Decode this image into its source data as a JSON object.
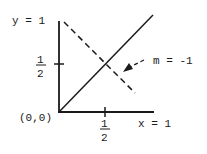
{
  "diagram": {
    "type": "line-graph",
    "labels": {
      "y_top": "y = 1",
      "x_right": "x = 1",
      "origin": "(0,0)",
      "half_num": "1",
      "half_den": "2",
      "slope": "m = -1"
    },
    "lines": [
      {
        "name": "solid-line",
        "style": "solid",
        "from": [
          0,
          0
        ],
        "to": [
          1,
          1
        ]
      },
      {
        "name": "dashed-line",
        "style": "dashed",
        "from": [
          0,
          1
        ],
        "to": [
          0.75,
          0.25
        ],
        "slope": -1
      }
    ],
    "ticks": {
      "x": 0.5,
      "y": 0.5
    },
    "colors": {
      "ink": "#1a1a1a",
      "background": "#ffffff"
    }
  }
}
